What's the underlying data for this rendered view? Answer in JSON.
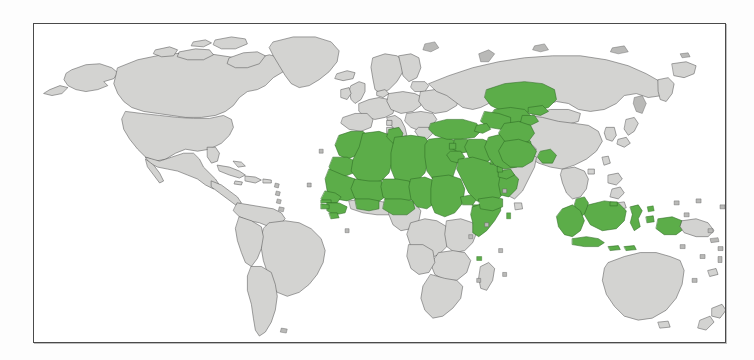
{
  "figure": {
    "kind": "world-map",
    "frame_border_color": "#4a4a4a",
    "background_color": "#ffffff",
    "ocean_color": "#ffffff",
    "projection": "equirectangular"
  },
  "legend": {
    "highlight_color": "#5cad49",
    "highlight_stroke": "#2e6b24",
    "base_color": "#d3d3d1",
    "base_stroke": "#585858",
    "highlight_meaning": "Muslim-majority countries",
    "base_meaning": "Other countries"
  },
  "regions": {
    "highlighted": [
      "Morocco",
      "Western Sahara",
      "Algeria",
      "Tunisia",
      "Libya",
      "Egypt",
      "Mauritania",
      "Mali",
      "Niger",
      "Chad",
      "Sudan",
      "Senegal",
      "Gambia",
      "Guinea",
      "Guinea-Bissau",
      "Sierra Leone",
      "Burkina Faso",
      "Somalia",
      "Djibouti",
      "Comoros",
      "Turkey",
      "Syria",
      "Lebanon",
      "Jordan",
      "Iraq",
      "Saudi Arabia",
      "Yemen",
      "Oman",
      "United Arab Emirates",
      "Qatar",
      "Bahrain",
      "Kuwait",
      "Iran",
      "Afghanistan",
      "Pakistan",
      "Turkmenistan",
      "Uzbekistan",
      "Tajikistan",
      "Kyrgyzstan",
      "Kazakhstan",
      "Azerbaijan",
      "Bangladesh",
      "Malaysia",
      "Brunei",
      "Indonesia",
      "Maldives"
    ],
    "not_highlighted": [
      "United States",
      "Canada",
      "Mexico",
      "Greenland",
      "Brazil",
      "Argentina",
      "Russia",
      "China",
      "India",
      "Australia",
      "European countries",
      "Sub-Saharan African countries",
      "Japan",
      "New Zealand"
    ]
  },
  "continents": [
    {
      "name": "North America",
      "highlighted": false
    },
    {
      "name": "South America",
      "highlighted": false
    },
    {
      "name": "Europe",
      "highlighted": false
    },
    {
      "name": "Africa",
      "highlighted": true
    },
    {
      "name": "Asia",
      "highlighted": true
    },
    {
      "name": "Oceania",
      "highlighted": false
    }
  ]
}
